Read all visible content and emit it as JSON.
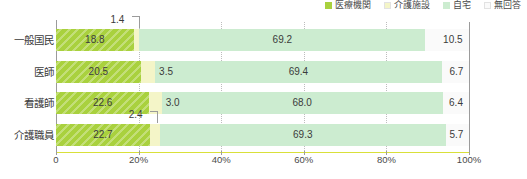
{
  "chart_data": {
    "type": "bar",
    "orientation": "horizontal",
    "stacked": true,
    "normalized_percent": true,
    "title": "",
    "subtitle": "",
    "xlabel": "",
    "ylabel": "",
    "xlim": [
      0,
      100
    ],
    "xticks": [
      0,
      20,
      40,
      60,
      80,
      100
    ],
    "xtick_labels": [
      "0",
      "20%",
      "40%",
      "60%",
      "80%",
      "100%"
    ],
    "grid": "vertical-dotted",
    "legend_position": "top-right",
    "categories": [
      "一般国民",
      "医師",
      "看護師",
      "介護職員"
    ],
    "series": [
      {
        "name": "医療機関",
        "color": "#a9d13e",
        "values": [
          18.8,
          20.5,
          22.6,
          22.7
        ]
      },
      {
        "name": "介護施設",
        "color": "#f4f5c8",
        "values": [
          1.4,
          3.5,
          3.0,
          2.4
        ]
      },
      {
        "name": "自宅",
        "color": "#ccecd0",
        "values": [
          69.2,
          69.4,
          68.0,
          69.3
        ]
      },
      {
        "name": "無回答",
        "color": "#fafafa",
        "values": [
          10.5,
          6.7,
          6.4,
          5.7
        ]
      }
    ],
    "annotations": [
      {
        "text": "1.4",
        "category": "一般国民",
        "series": "介護施設",
        "style": "leader-line"
      },
      {
        "text": "2.4",
        "category": "介護職員",
        "series": "介護施設",
        "style": "leader-line"
      }
    ]
  },
  "legend": {
    "items": [
      {
        "label": "医療機関",
        "color": "#a9d13e"
      },
      {
        "label": "介護施設",
        "color": "#f4f5c8"
      },
      {
        "label": "自宅",
        "color": "#ccecd0"
      },
      {
        "label": "無回答",
        "color": "#fafafa"
      }
    ]
  },
  "axis": {
    "x": {
      "ticks": [
        {
          "label": "0",
          "pos": 0
        },
        {
          "label": "20%",
          "pos": 20
        },
        {
          "label": "40%",
          "pos": 40
        },
        {
          "label": "60%",
          "pos": 60
        },
        {
          "label": "80%",
          "pos": 80
        },
        {
          "label": "100%",
          "pos": 100
        }
      ]
    },
    "y": {
      "categories": [
        "一般国民",
        "医師",
        "看護師",
        "介護職員"
      ]
    }
  },
  "rows": [
    {
      "category": "一般国民",
      "segments": [
        {
          "label": "18.8",
          "value": 18.8,
          "series": "医療機関",
          "inside": true
        },
        {
          "label": "1.4",
          "value": 1.4,
          "series": "介護施設",
          "inside": false,
          "callout": true
        },
        {
          "label": "69.2",
          "value": 69.2,
          "series": "自宅",
          "inside": true
        },
        {
          "label": "10.5",
          "value": 10.5,
          "series": "無回答",
          "inside": true
        }
      ]
    },
    {
      "category": "医師",
      "segments": [
        {
          "label": "20.5",
          "value": 20.5,
          "series": "医療機関",
          "inside": true
        },
        {
          "label": "3.5",
          "value": 3.5,
          "series": "介護施設",
          "inside": false,
          "callout": false
        },
        {
          "label": "69.4",
          "value": 69.4,
          "series": "自宅",
          "inside": true
        },
        {
          "label": "6.7",
          "value": 6.7,
          "series": "無回答",
          "inside": true
        }
      ]
    },
    {
      "category": "看護師",
      "segments": [
        {
          "label": "22.6",
          "value": 22.6,
          "series": "医療機関",
          "inside": true
        },
        {
          "label": "3.0",
          "value": 3.0,
          "series": "介護施設",
          "inside": false,
          "callout": false
        },
        {
          "label": "68.0",
          "value": 68.0,
          "series": "自宅",
          "inside": true
        },
        {
          "label": "6.4",
          "value": 6.4,
          "series": "無回答",
          "inside": true
        }
      ]
    },
    {
      "category": "介護職員",
      "segments": [
        {
          "label": "22.7",
          "value": 22.7,
          "series": "医療機関",
          "inside": true
        },
        {
          "label": "2.4",
          "value": 2.4,
          "series": "介護施設",
          "inside": false,
          "callout": true
        },
        {
          "label": "69.3",
          "value": 69.3,
          "series": "自宅",
          "inside": true
        },
        {
          "label": "5.7",
          "value": 5.7,
          "series": "無回答",
          "inside": true
        }
      ]
    }
  ]
}
